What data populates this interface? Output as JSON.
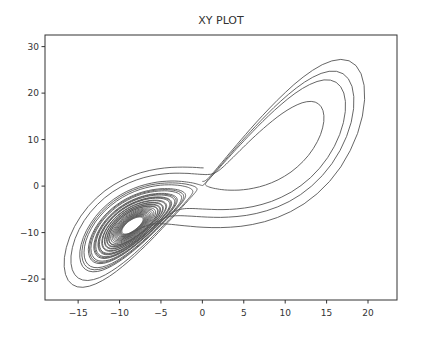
{
  "chart_data": {
    "type": "line",
    "title": "XY PLOT",
    "xlabel": "",
    "ylabel": "",
    "xlim": [
      -19,
      23.5
    ],
    "ylim": [
      -24.5,
      32.5
    ],
    "xticks": [
      -15,
      -10,
      -5,
      0,
      5,
      10,
      15,
      20
    ],
    "yticks": [
      -20,
      -10,
      0,
      10,
      20,
      30
    ],
    "xtick_labels": [
      "−15",
      "−10",
      "−5",
      "0",
      "5",
      "10",
      "15",
      "20"
    ],
    "ytick_labels": [
      "−20",
      "−10",
      "0",
      "10",
      "20",
      "30"
    ],
    "grid": false,
    "legend": null,
    "series": [
      {
        "name": "trajectory",
        "description": "Lorenz attractor x-y projection",
        "generator": {
          "system": "lorenz",
          "sigma": 10,
          "rho": 28,
          "beta": 2.6666667,
          "initial": [
            0.0,
            1.0,
            1.05
          ],
          "dt": 0.01,
          "steps": 2600
        },
        "color": "#555555"
      }
    ]
  },
  "figure": {
    "plot_box_px": {
      "left": 45,
      "top": 35,
      "right": 397,
      "bottom": 300
    },
    "line_color": "#555555",
    "frame_color": "#333333"
  }
}
